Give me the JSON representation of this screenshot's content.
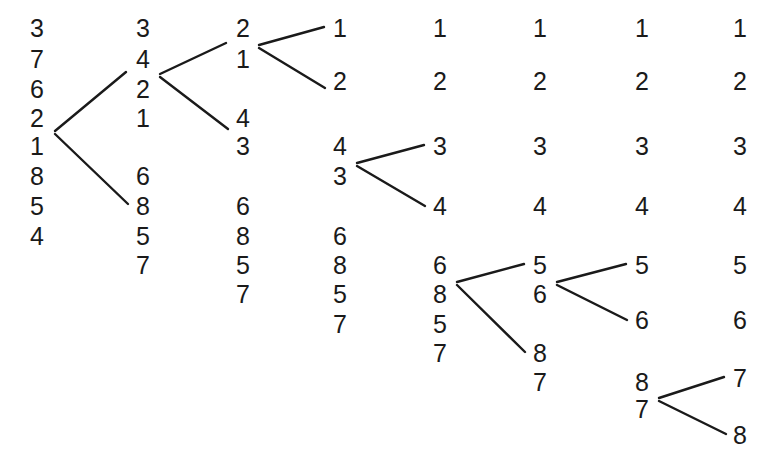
{
  "figure": {
    "type": "sorting-network-trace",
    "background_color": "#ffffff",
    "ink_color": "#1a1a1a",
    "font_size_px": 25,
    "line_width_px": 2.4,
    "column_count": 8,
    "column_x": [
      37,
      143,
      243,
      340,
      440,
      540,
      642,
      740
    ]
  },
  "columns": [
    {
      "index": 0,
      "name": "stage-1",
      "x": 37,
      "digits": [
        {
          "value": "3",
          "x": 37,
          "y": 28
        },
        {
          "value": "7",
          "x": 37,
          "y": 59
        },
        {
          "value": "6",
          "x": 37,
          "y": 89
        },
        {
          "value": "2",
          "x": 37,
          "y": 118
        },
        {
          "value": "1",
          "x": 37,
          "y": 146
        },
        {
          "value": "8",
          "x": 37,
          "y": 176
        },
        {
          "value": "5",
          "x": 37,
          "y": 206
        },
        {
          "value": "4",
          "x": 37,
          "y": 236
        }
      ]
    },
    {
      "index": 1,
      "name": "stage-2",
      "x": 143,
      "digits": [
        {
          "value": "3",
          "x": 143,
          "y": 28
        },
        {
          "value": "4",
          "x": 143,
          "y": 59
        },
        {
          "value": "2",
          "x": 143,
          "y": 89
        },
        {
          "value": "1",
          "x": 143,
          "y": 118
        },
        {
          "value": "6",
          "x": 143,
          "y": 176
        },
        {
          "value": "8",
          "x": 143,
          "y": 206
        },
        {
          "value": "5",
          "x": 143,
          "y": 236
        },
        {
          "value": "7",
          "x": 143,
          "y": 265
        }
      ]
    },
    {
      "index": 2,
      "name": "stage-3",
      "x": 243,
      "digits": [
        {
          "value": "2",
          "x": 243,
          "y": 28
        },
        {
          "value": "1",
          "x": 243,
          "y": 59
        },
        {
          "value": "4",
          "x": 243,
          "y": 118
        },
        {
          "value": "3",
          "x": 243,
          "y": 146
        },
        {
          "value": "6",
          "x": 243,
          "y": 206
        },
        {
          "value": "8",
          "x": 243,
          "y": 236
        },
        {
          "value": "5",
          "x": 243,
          "y": 265
        },
        {
          "value": "7",
          "x": 243,
          "y": 294
        }
      ]
    },
    {
      "index": 3,
      "name": "stage-4",
      "x": 340,
      "digits": [
        {
          "value": "1",
          "x": 340,
          "y": 28
        },
        {
          "value": "2",
          "x": 340,
          "y": 81
        },
        {
          "value": "4",
          "x": 340,
          "y": 146
        },
        {
          "value": "3",
          "x": 340,
          "y": 176
        },
        {
          "value": "6",
          "x": 340,
          "y": 236
        },
        {
          "value": "8",
          "x": 340,
          "y": 265
        },
        {
          "value": "5",
          "x": 340,
          "y": 294
        },
        {
          "value": "7",
          "x": 340,
          "y": 324
        }
      ]
    },
    {
      "index": 4,
      "name": "stage-5",
      "x": 440,
      "digits": [
        {
          "value": "1",
          "x": 440,
          "y": 28
        },
        {
          "value": "2",
          "x": 440,
          "y": 81
        },
        {
          "value": "3",
          "x": 440,
          "y": 146
        },
        {
          "value": "4",
          "x": 440,
          "y": 206
        },
        {
          "value": "6",
          "x": 440,
          "y": 265
        },
        {
          "value": "8",
          "x": 440,
          "y": 294
        },
        {
          "value": "5",
          "x": 440,
          "y": 324
        },
        {
          "value": "7",
          "x": 440,
          "y": 353
        }
      ]
    },
    {
      "index": 5,
      "name": "stage-6",
      "x": 540,
      "digits": [
        {
          "value": "1",
          "x": 540,
          "y": 28
        },
        {
          "value": "2",
          "x": 540,
          "y": 81
        },
        {
          "value": "3",
          "x": 540,
          "y": 146
        },
        {
          "value": "4",
          "x": 540,
          "y": 206
        },
        {
          "value": "5",
          "x": 540,
          "y": 265
        },
        {
          "value": "6",
          "x": 540,
          "y": 294
        },
        {
          "value": "8",
          "x": 540,
          "y": 353
        },
        {
          "value": "7",
          "x": 540,
          "y": 382
        }
      ]
    },
    {
      "index": 6,
      "name": "stage-7",
      "x": 642,
      "digits": [
        {
          "value": "1",
          "x": 642,
          "y": 28
        },
        {
          "value": "2",
          "x": 642,
          "y": 81
        },
        {
          "value": "3",
          "x": 642,
          "y": 146
        },
        {
          "value": "4",
          "x": 642,
          "y": 206
        },
        {
          "value": "5",
          "x": 642,
          "y": 265
        },
        {
          "value": "6",
          "x": 642,
          "y": 320
        },
        {
          "value": "8",
          "x": 642,
          "y": 382
        },
        {
          "value": "7",
          "x": 642,
          "y": 409
        }
      ]
    },
    {
      "index": 7,
      "name": "stage-8-sorted",
      "x": 740,
      "digits": [
        {
          "value": "1",
          "x": 740,
          "y": 28
        },
        {
          "value": "2",
          "x": 740,
          "y": 81
        },
        {
          "value": "3",
          "x": 740,
          "y": 146
        },
        {
          "value": "4",
          "x": 740,
          "y": 206
        },
        {
          "value": "5",
          "x": 740,
          "y": 265
        },
        {
          "value": "6",
          "x": 740,
          "y": 320
        },
        {
          "value": "7",
          "x": 740,
          "y": 378
        },
        {
          "value": "8",
          "x": 740,
          "y": 435
        }
      ]
    }
  ],
  "links": [
    {
      "name": "link-c1-to-c2-upper",
      "x1": 55,
      "y1": 131,
      "x2": 126,
      "y2": 72
    },
    {
      "name": "link-c1-to-c2-lower",
      "x1": 55,
      "y1": 134,
      "x2": 128,
      "y2": 204
    },
    {
      "name": "link-c2-to-c3-upper",
      "x1": 160,
      "y1": 74,
      "x2": 226,
      "y2": 43
    },
    {
      "name": "link-c2-to-c3-lower",
      "x1": 160,
      "y1": 77,
      "x2": 228,
      "y2": 129
    },
    {
      "name": "link-c3-to-c4-upper",
      "x1": 259,
      "y1": 45,
      "x2": 324,
      "y2": 27
    },
    {
      "name": "link-c3-to-c4-lower",
      "x1": 259,
      "y1": 48,
      "x2": 325,
      "y2": 88
    },
    {
      "name": "link-c4-to-c5-upper",
      "x1": 357,
      "y1": 163,
      "x2": 424,
      "y2": 145
    },
    {
      "name": "link-c4-to-c5-lower",
      "x1": 357,
      "y1": 166,
      "x2": 425,
      "y2": 206
    },
    {
      "name": "link-c5-to-c6-upper",
      "x1": 457,
      "y1": 282,
      "x2": 524,
      "y2": 264
    },
    {
      "name": "link-c5-to-c6-lower",
      "x1": 457,
      "y1": 285,
      "x2": 525,
      "y2": 352
    },
    {
      "name": "link-c6-to-c7-upper",
      "x1": 557,
      "y1": 282,
      "x2": 626,
      "y2": 264
    },
    {
      "name": "link-c6-to-c7-lower",
      "x1": 557,
      "y1": 285,
      "x2": 627,
      "y2": 320
    },
    {
      "name": "link-c7-to-c8-upper",
      "x1": 659,
      "y1": 398,
      "x2": 724,
      "y2": 377
    },
    {
      "name": "link-c7-to-c8-lower",
      "x1": 659,
      "y1": 401,
      "x2": 726,
      "y2": 434
    }
  ]
}
